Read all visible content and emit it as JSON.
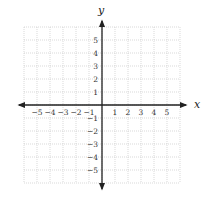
{
  "axes": {
    "x_label": "x",
    "y_label": "y"
  },
  "grid": {
    "min": -6,
    "max": 6,
    "step": 1
  },
  "x_ticks": [
    "−5",
    "−4",
    "−3",
    "−2",
    "−1",
    "1",
    "2",
    "3",
    "4",
    "5"
  ],
  "y_ticks": [
    "5",
    "4",
    "3",
    "2",
    "1",
    "−1",
    "−2",
    "−3",
    "−4",
    "−5"
  ],
  "colors": {
    "grid": "#c8c8c8",
    "axis": "#222222",
    "text": "#333333"
  }
}
